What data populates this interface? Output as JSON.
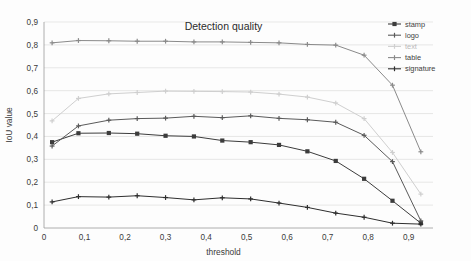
{
  "chart_data": {
    "type": "line",
    "title": "Detection quality",
    "xlabel": "threshold",
    "ylabel": "IoU value",
    "xlim": [
      0,
      0.96
    ],
    "ylim": [
      0,
      0.9
    ],
    "grid": true,
    "legend_position": "top-right",
    "xticks": [
      "0",
      "0,1",
      "0,2",
      "0,3",
      "0,4",
      "0,5",
      "0,6",
      "0,7",
      "0,8",
      "0,9"
    ],
    "xtick_values": [
      0,
      0.1,
      0.2,
      0.3,
      0.4,
      0.5,
      0.6,
      0.7,
      0.8,
      0.9
    ],
    "yticks": [
      "0",
      "0,1",
      "0,2",
      "0,3",
      "0,4",
      "0,5",
      "0,6",
      "0,7",
      "0,8",
      "0,9"
    ],
    "ytick_values": [
      0,
      0.1,
      0.2,
      0.3,
      0.4,
      0.5,
      0.6,
      0.7,
      0.8,
      0.9
    ],
    "x": [
      0.02,
      0.085,
      0.16,
      0.23,
      0.3,
      0.37,
      0.44,
      0.51,
      0.58,
      0.65,
      0.72,
      0.79,
      0.86,
      0.93
    ],
    "series": [
      {
        "name": "stamp",
        "color": "#3c3c3c",
        "marker": "square",
        "values": [
          0.375,
          0.414,
          0.415,
          0.412,
          0.403,
          0.4,
          0.382,
          0.375,
          0.363,
          0.335,
          0.293,
          0.215,
          0.119,
          0.021
        ]
      },
      {
        "name": "logo",
        "color": "#5a5a5a",
        "marker": "plus",
        "values": [
          0.358,
          0.446,
          0.471,
          0.478,
          0.48,
          0.488,
          0.482,
          0.49,
          0.479,
          0.473,
          0.462,
          0.405,
          0.29,
          0.031
        ]
      },
      {
        "name": "text",
        "color": "#cfcfcf",
        "marker": "plus",
        "values": [
          0.468,
          0.566,
          0.586,
          0.592,
          0.598,
          0.597,
          0.596,
          0.594,
          0.585,
          0.572,
          0.546,
          0.478,
          0.33,
          0.148
        ]
      },
      {
        "name": "table",
        "color": "#8a8a8a",
        "marker": "plus",
        "values": [
          0.809,
          0.819,
          0.818,
          0.816,
          0.816,
          0.813,
          0.813,
          0.811,
          0.809,
          0.802,
          0.799,
          0.755,
          0.624,
          0.333
        ]
      },
      {
        "name": "signature",
        "color": "#2e2e2e",
        "marker": "plus",
        "values": [
          0.114,
          0.137,
          0.135,
          0.141,
          0.133,
          0.123,
          0.132,
          0.127,
          0.109,
          0.09,
          0.065,
          0.047,
          0.021,
          0.017
        ]
      }
    ]
  }
}
